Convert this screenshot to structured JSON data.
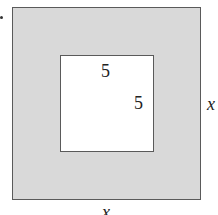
{
  "diagram": {
    "colors": {
      "shaded_region": "#d9d9d9",
      "inner_region": "#ffffff",
      "border": "#5a5a5a"
    },
    "outer_square": {
      "side_label_right": "x",
      "side_label_bottom": "x"
    },
    "inner_square": {
      "side_label_top": "5",
      "side_label_right": "5"
    }
  }
}
